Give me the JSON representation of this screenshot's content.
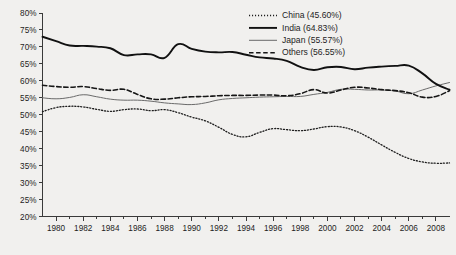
{
  "chart_data": {
    "type": "line",
    "title": "",
    "subtitle": "",
    "xlabel": "",
    "ylabel": "",
    "xlim": [
      1979,
      2009
    ],
    "ylim": [
      20,
      80
    ],
    "grid": false,
    "legend_position": "top-right",
    "y_tick_labels": [
      "80%",
      "75%",
      "70%",
      "65%",
      "60%",
      "55%",
      "50%",
      "45%",
      "40%",
      "35%",
      "30%",
      "25%",
      "20%"
    ],
    "y_ticks": [
      80,
      75,
      70,
      65,
      60,
      55,
      50,
      45,
      40,
      35,
      30,
      25,
      20
    ],
    "x_tick_labels": [
      "1980",
      "1982",
      "1984",
      "1986",
      "1988",
      "1990",
      "1992",
      "1994",
      "1996",
      "1998",
      "2000",
      "2002",
      "2004",
      "2006",
      "2008"
    ],
    "x_ticks": [
      1980,
      1982,
      1984,
      1986,
      1988,
      1990,
      1992,
      1994,
      1996,
      1998,
      2000,
      2002,
      2004,
      2006,
      2008
    ],
    "x_minor_ticks": [
      1981,
      1983,
      1985,
      1987,
      1989,
      1991,
      1993,
      1995,
      1997,
      1999,
      2001,
      2003,
      2005,
      2007
    ],
    "x": [
      1979,
      1980,
      1981,
      1982,
      1983,
      1984,
      1985,
      1986,
      1987,
      1988,
      1989,
      1990,
      1991,
      1992,
      1993,
      1994,
      1995,
      1996,
      1997,
      1998,
      1999,
      2000,
      2001,
      2002,
      2003,
      2004,
      2005,
      2006,
      2007,
      2008,
      2009
    ],
    "series": [
      {
        "name": "China",
        "legend_label": "China (45.60%)",
        "mean_label": "45.60%",
        "style": "dotted",
        "color": "#1d1d1d",
        "width": 1.3,
        "dasharray": "1.1,1.9",
        "values": [
          50.9,
          52.1,
          52.5,
          52.3,
          51.6,
          51.0,
          51.5,
          51.7,
          51.2,
          51.5,
          50.6,
          49.3,
          48.2,
          46.3,
          44.2,
          43.5,
          44.8,
          45.9,
          45.6,
          45.3,
          45.8,
          46.5,
          46.4,
          45.3,
          43.4,
          41.1,
          38.9,
          37.1,
          36.1,
          35.7,
          35.8
        ]
      },
      {
        "name": "India",
        "legend_label": "India (64.83%)",
        "mean_label": "64.83%",
        "style": "solid-thick",
        "color": "#111111",
        "width": 1.9,
        "dasharray": "none",
        "values": [
          73.0,
          71.7,
          70.4,
          70.3,
          70.1,
          69.6,
          67.6,
          67.8,
          67.8,
          66.8,
          70.8,
          69.4,
          68.6,
          68.4,
          68.5,
          67.7,
          66.9,
          66.6,
          65.9,
          64.1,
          63.2,
          64.0,
          64.1,
          63.4,
          63.9,
          64.2,
          64.4,
          64.5,
          62.2,
          59.1,
          57.4
        ]
      },
      {
        "name": "Japan",
        "legend_label": "Japan (55.57%)",
        "mean_label": "55.57%",
        "style": "solid-thin",
        "color": "#6a6a6a",
        "width": 1.0,
        "dasharray": "none",
        "values": [
          55.0,
          54.7,
          55.1,
          55.9,
          55.3,
          54.6,
          54.3,
          54.3,
          54.0,
          53.5,
          53.2,
          53.0,
          53.5,
          54.4,
          54.8,
          55.0,
          55.2,
          55.3,
          55.4,
          55.4,
          56.0,
          56.6,
          57.5,
          57.5,
          57.3,
          57.3,
          57.0,
          56.2,
          57.3,
          58.5,
          59.5
        ]
      },
      {
        "name": "Others",
        "legend_label": "Others (56.55%)",
        "mean_label": "56.55%",
        "style": "dashed",
        "color": "#161616",
        "width": 1.6,
        "dasharray": "4.5,2.6",
        "values": [
          58.7,
          58.3,
          58.1,
          58.3,
          57.7,
          57.2,
          57.5,
          56.0,
          54.7,
          54.6,
          55.0,
          55.3,
          55.4,
          55.6,
          55.7,
          55.7,
          55.8,
          55.8,
          55.6,
          56.2,
          57.4,
          56.4,
          57.3,
          58.1,
          57.9,
          57.4,
          57.1,
          56.5,
          55.2,
          55.4,
          57.1
        ]
      }
    ]
  },
  "theme": {
    "background": "#f1f0ee",
    "axis_color": "#3a3a3a",
    "text_color": "#1d1d1d"
  }
}
